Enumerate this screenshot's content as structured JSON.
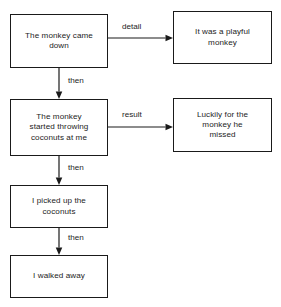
{
  "diagram": {
    "type": "flowchart",
    "background_color": "#ffffff",
    "line_color": "#1a1a1a",
    "text_color": "#1c1c1c",
    "nodes": [
      {
        "id": "came-down",
        "label": "The monkey came\ndown",
        "x": 10,
        "y": 14,
        "w": 98,
        "h": 54
      },
      {
        "id": "playful",
        "label": "It was a playful\nmonkey",
        "x": 173,
        "y": 11,
        "w": 99,
        "h": 53
      },
      {
        "id": "throwing-coconuts",
        "label": "The monkey\nstarted throwing\ncoconuts at me",
        "x": 10,
        "y": 99,
        "w": 98,
        "h": 57
      },
      {
        "id": "luckily-missed",
        "label": "Luckily for the\nmonkey he\nmissed",
        "x": 173,
        "y": 98,
        "w": 99,
        "h": 54
      },
      {
        "id": "picked-up",
        "label": "I picked up the\ncoconuts",
        "x": 10,
        "y": 185,
        "w": 98,
        "h": 43
      },
      {
        "id": "walked-away",
        "label": "I walked away",
        "x": 10,
        "y": 255,
        "w": 98,
        "h": 43
      }
    ],
    "edges": [
      {
        "id": "detail-edge",
        "from": "came-down",
        "to": "playful",
        "label": "detail",
        "label_x": 122,
        "label_y": 22,
        "x1": 108,
        "y1": 38,
        "x2": 173,
        "y2": 38,
        "direction": "horizontal"
      },
      {
        "id": "then-edge-1",
        "from": "came-down",
        "to": "throwing-coconuts",
        "label": "then",
        "label_x": 68,
        "label_y": 76,
        "x1": 59,
        "y1": 68,
        "x2": 59,
        "y2": 99,
        "direction": "vertical"
      },
      {
        "id": "result-edge",
        "from": "throwing-coconuts",
        "to": "luckily-missed",
        "label": "result",
        "label_x": 122,
        "label_y": 110,
        "x1": 108,
        "y1": 127,
        "x2": 173,
        "y2": 127,
        "direction": "horizontal"
      },
      {
        "id": "then-edge-2",
        "from": "throwing-coconuts",
        "to": "picked-up",
        "label": "then",
        "label_x": 68,
        "label_y": 163,
        "x1": 59,
        "y1": 156,
        "x2": 59,
        "y2": 185,
        "direction": "vertical"
      },
      {
        "id": "then-edge-3",
        "from": "picked-up",
        "to": "walked-away",
        "label": "then",
        "label_x": 68,
        "label_y": 233,
        "x1": 59,
        "y1": 228,
        "x2": 59,
        "y2": 255,
        "direction": "vertical"
      }
    ]
  }
}
